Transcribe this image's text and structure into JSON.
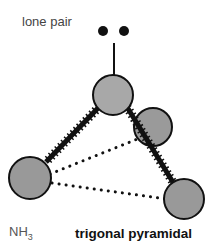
{
  "labels": {
    "lone_pair": "lone pair",
    "formula_main": "NH",
    "formula_sub": "3",
    "geometry": "trigonal pyramidal"
  },
  "colors": {
    "atom_fill": "#9a9a9a",
    "outline": "#111111",
    "background": "#ffffff"
  },
  "molecule": {
    "central_atom": "N",
    "bonded_atoms": [
      "H",
      "H",
      "H"
    ],
    "lone_pairs": 1
  }
}
